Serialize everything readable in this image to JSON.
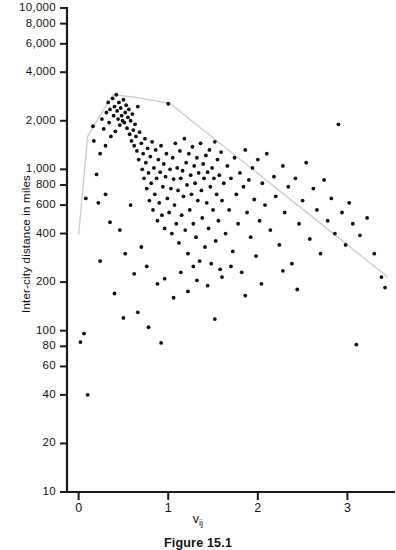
{
  "figure": {
    "caption": "Figure 15.1",
    "background_color": "#ffffff",
    "axis_color": "#1a1a1a",
    "point_color": "#111111",
    "envelope_color": "#c9c9c9"
  },
  "chart_data": {
    "type": "scatter",
    "title": "",
    "subtitle": "",
    "xlabel": "v",
    "xlabel_subscript": "ij",
    "ylabel": "Inter-city distance in miles",
    "grid": false,
    "legend": null,
    "xscale": "linear",
    "yscale": "log",
    "xlim": [
      -0.13,
      3.52
    ],
    "ylim": [
      10,
      10000
    ],
    "xticks": [
      0,
      1,
      2,
      3
    ],
    "xtick_labels": [
      "0",
      "1",
      "2",
      "3"
    ],
    "yticks": [
      10,
      20,
      40,
      60,
      80,
      100,
      200,
      400,
      600,
      800,
      1000,
      2000,
      4000,
      6000,
      8000,
      10000
    ],
    "ytick_labels": [
      "10",
      "20",
      "40",
      "60",
      "80",
      "100",
      "200",
      "400",
      "600",
      "800",
      "1,000",
      "2,000",
      "4,000",
      "6,000",
      "8,000",
      "10,000"
    ],
    "series": [
      {
        "name": "city pairs",
        "marker": "filled-circle",
        "points": [
          [
            0.02,
            85
          ],
          [
            0.06,
            96
          ],
          [
            0.1,
            40
          ],
          [
            0.08,
            660
          ],
          [
            0.16,
            1850
          ],
          [
            0.17,
            1500
          ],
          [
            0.2,
            930
          ],
          [
            0.22,
            620
          ],
          [
            0.24,
            1250
          ],
          [
            0.26,
            2050
          ],
          [
            0.28,
            1780
          ],
          [
            0.3,
            1400
          ],
          [
            0.31,
            2250
          ],
          [
            0.33,
            2600
          ],
          [
            0.34,
            1950
          ],
          [
            0.35,
            2350
          ],
          [
            0.36,
            1600
          ],
          [
            0.38,
            2750
          ],
          [
            0.39,
            2150
          ],
          [
            0.4,
            2450
          ],
          [
            0.41,
            1720
          ],
          [
            0.42,
            2900
          ],
          [
            0.43,
            2300
          ],
          [
            0.44,
            2050
          ],
          [
            0.45,
            2600
          ],
          [
            0.46,
            1880
          ],
          [
            0.47,
            2400
          ],
          [
            0.48,
            2150
          ],
          [
            0.49,
            2000
          ],
          [
            0.5,
            2700
          ],
          [
            0.51,
            1950
          ],
          [
            0.52,
            2250
          ],
          [
            0.53,
            2500
          ],
          [
            0.54,
            1800
          ],
          [
            0.55,
            2100
          ],
          [
            0.56,
            2350
          ],
          [
            0.57,
            1650
          ],
          [
            0.58,
            2000
          ],
          [
            0.59,
            1500
          ],
          [
            0.6,
            2200
          ],
          [
            0.61,
            1750
          ],
          [
            0.62,
            1400
          ],
          [
            0.63,
            1900
          ],
          [
            0.64,
            1600
          ],
          [
            0.65,
            1300
          ],
          [
            0.66,
            2450
          ],
          [
            0.67,
            1150
          ],
          [
            0.68,
            1700
          ],
          [
            0.7,
            1450
          ],
          [
            0.71,
            1000
          ],
          [
            0.72,
            1250
          ],
          [
            0.73,
            880
          ],
          [
            0.74,
            1550
          ],
          [
            0.75,
            1100
          ],
          [
            0.76,
            760
          ],
          [
            0.77,
            1350
          ],
          [
            0.78,
            950
          ],
          [
            0.79,
            640
          ],
          [
            0.8,
            1200
          ],
          [
            0.81,
            820
          ],
          [
            0.82,
            1480
          ],
          [
            0.83,
            560
          ],
          [
            0.84,
            1020
          ],
          [
            0.85,
            700
          ],
          [
            0.86,
            1320
          ],
          [
            0.87,
            880
          ],
          [
            0.88,
            480
          ],
          [
            0.89,
            1150
          ],
          [
            0.9,
            620
          ],
          [
            0.91,
            960
          ],
          [
            0.92,
            1400
          ],
          [
            0.93,
            520
          ],
          [
            0.94,
            780
          ],
          [
            0.95,
            1080
          ],
          [
            0.96,
            430
          ],
          [
            0.97,
            900
          ],
          [
            0.98,
            1250
          ],
          [
            0.99,
            660
          ],
          [
            1.0,
            2550
          ],
          [
            1.01,
            540
          ],
          [
            1.02,
            1000
          ],
          [
            1.03,
            760
          ],
          [
            1.04,
            400
          ],
          [
            1.05,
            1180
          ],
          [
            1.06,
            870
          ],
          [
            1.07,
            600
          ],
          [
            1.08,
            1450
          ],
          [
            1.09,
            460
          ],
          [
            1.1,
            1020
          ],
          [
            1.11,
            740
          ],
          [
            1.12,
            350
          ],
          [
            1.13,
            1300
          ],
          [
            1.14,
            880
          ],
          [
            1.15,
            520
          ],
          [
            1.16,
            980
          ],
          [
            1.17,
            680
          ],
          [
            1.18,
            1550
          ],
          [
            1.19,
            420
          ],
          [
            1.2,
            1100
          ],
          [
            1.21,
            800
          ],
          [
            1.22,
            300
          ],
          [
            1.23,
            1250
          ],
          [
            1.24,
            560
          ],
          [
            1.25,
            920
          ],
          [
            1.26,
            700
          ],
          [
            1.27,
            1380
          ],
          [
            1.28,
            460
          ],
          [
            1.29,
            1050
          ],
          [
            1.3,
            820
          ],
          [
            1.31,
            380
          ],
          [
            1.32,
            1180
          ],
          [
            1.33,
            640
          ],
          [
            1.34,
            950
          ],
          [
            1.35,
            270
          ],
          [
            1.36,
            1450
          ],
          [
            1.37,
            740
          ],
          [
            1.38,
            500
          ],
          [
            1.39,
            1080
          ],
          [
            1.4,
            880
          ],
          [
            1.41,
            330
          ],
          [
            1.42,
            1220
          ],
          [
            1.43,
            620
          ],
          [
            1.44,
            960
          ],
          [
            1.45,
            430
          ],
          [
            1.46,
            1320
          ],
          [
            1.47,
            780
          ],
          [
            1.48,
            260
          ],
          [
            1.49,
            1020
          ],
          [
            1.5,
            560
          ],
          [
            1.51,
            880
          ],
          [
            1.52,
            1480
          ],
          [
            1.53,
            360
          ],
          [
            1.54,
            700
          ],
          [
            1.55,
            1150
          ],
          [
            1.56,
            480
          ],
          [
            1.57,
            920
          ],
          [
            1.58,
            240
          ],
          [
            1.59,
            1280
          ],
          [
            1.6,
            640
          ],
          [
            1.62,
            820
          ],
          [
            1.64,
            400
          ],
          [
            1.66,
            1050
          ],
          [
            1.68,
            560
          ],
          [
            1.7,
            880
          ],
          [
            1.72,
            310
          ],
          [
            1.74,
            1180
          ],
          [
            1.76,
            700
          ],
          [
            1.78,
            460
          ],
          [
            1.8,
            950
          ],
          [
            1.82,
            230
          ],
          [
            1.84,
            780
          ],
          [
            1.86,
            1320
          ],
          [
            1.88,
            540
          ],
          [
            1.9,
            860
          ],
          [
            1.92,
            380
          ],
          [
            1.94,
            1020
          ],
          [
            1.96,
            650
          ],
          [
            1.98,
            290
          ],
          [
            2.0,
            1150
          ],
          [
            2.02,
            480
          ],
          [
            2.05,
            820
          ],
          [
            2.08,
            600
          ],
          [
            2.1,
            1250
          ],
          [
            2.14,
            420
          ],
          [
            2.18,
            900
          ],
          [
            2.2,
            680
          ],
          [
            2.24,
            340
          ],
          [
            2.28,
            1050
          ],
          [
            2.3,
            540
          ],
          [
            2.34,
            780
          ],
          [
            2.38,
            260
          ],
          [
            2.42,
            880
          ],
          [
            2.46,
            460
          ],
          [
            2.5,
            640
          ],
          [
            2.54,
            1100
          ],
          [
            2.58,
            370
          ],
          [
            2.62,
            760
          ],
          [
            2.66,
            560
          ],
          [
            2.7,
            300
          ],
          [
            2.74,
            860
          ],
          [
            2.78,
            480
          ],
          [
            2.82,
            660
          ],
          [
            2.86,
            400
          ],
          [
            2.9,
            1900
          ],
          [
            2.94,
            540
          ],
          [
            2.98,
            340
          ],
          [
            3.02,
            620
          ],
          [
            3.06,
            460
          ],
          [
            3.1,
            82
          ],
          [
            3.14,
            390
          ],
          [
            3.22,
            500
          ],
          [
            3.3,
            300
          ],
          [
            3.38,
            215
          ],
          [
            3.42,
            185
          ],
          [
            0.24,
            270
          ],
          [
            0.3,
            700
          ],
          [
            0.35,
            470
          ],
          [
            0.46,
            420
          ],
          [
            0.52,
            300
          ],
          [
            0.58,
            600
          ],
          [
            0.62,
            225
          ],
          [
            0.7,
            330
          ],
          [
            0.76,
            250
          ],
          [
            0.88,
            195
          ],
          [
            0.96,
            210
          ],
          [
            1.06,
            160
          ],
          [
            1.14,
            230
          ],
          [
            1.22,
            175
          ],
          [
            1.32,
            205
          ],
          [
            1.44,
            190
          ],
          [
            1.52,
            118
          ],
          [
            1.6,
            215
          ],
          [
            1.7,
            250
          ],
          [
            1.86,
            165
          ],
          [
            2.04,
            195
          ],
          [
            0.4,
            170
          ],
          [
            0.5,
            120
          ],
          [
            0.66,
            130
          ],
          [
            0.78,
            105
          ],
          [
            0.92,
            84
          ],
          [
            1.28,
            250
          ],
          [
            2.28,
            235
          ],
          [
            2.44,
            180
          ]
        ]
      }
    ],
    "annotations": [
      {
        "name": "envelope-polyline",
        "type": "polyline",
        "color": "#c9c9c9",
        "description": "faint gray boundary envelope enclosing the upper edge of the point cloud",
        "vertices": [
          [
            0.0,
            390
          ],
          [
            0.1,
            1600
          ],
          [
            0.38,
            2900
          ],
          [
            0.62,
            2800
          ],
          [
            1.02,
            2560
          ],
          [
            3.45,
            215
          ]
        ]
      }
    ]
  },
  "axes": {
    "y_title": "Inter-city distance in miles",
    "x_title_base": "v",
    "x_title_sub": "ij"
  }
}
